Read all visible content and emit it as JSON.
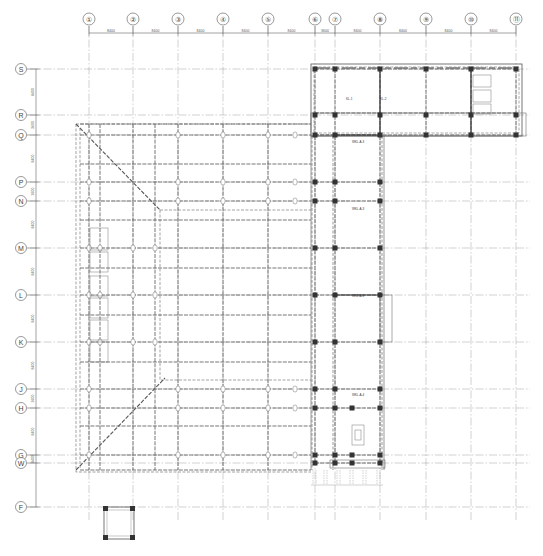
{
  "drawing": {
    "type": "structural-framing-plan",
    "background": "#ffffff",
    "line_color": "#555555",
    "column_color": "#333333"
  },
  "column_axes": [
    {
      "label": "①",
      "x": 89
    },
    {
      "label": "②",
      "x": 133
    },
    {
      "label": "③",
      "x": 178
    },
    {
      "label": "④",
      "x": 223
    },
    {
      "label": "⑤",
      "x": 268
    },
    {
      "label": "⑥",
      "x": 315
    },
    {
      "label": "⑦",
      "x": 335
    },
    {
      "label": "⑧",
      "x": 380
    },
    {
      "label": "⑨",
      "x": 426
    },
    {
      "label": "⑩",
      "x": 471
    },
    {
      "label": "⑪",
      "x": 516
    }
  ],
  "row_axes": [
    {
      "label": "S",
      "y": 69
    },
    {
      "label": "R",
      "y": 115
    },
    {
      "label": "Q",
      "y": 135
    },
    {
      "label": "P",
      "y": 182
    },
    {
      "label": "N",
      "y": 201
    },
    {
      "label": "M",
      "y": 248
    },
    {
      "label": "L",
      "y": 295
    },
    {
      "label": "K",
      "y": 342
    },
    {
      "label": "J",
      "y": 389
    },
    {
      "label": "H",
      "y": 408
    },
    {
      "label": "G",
      "y": 455
    },
    {
      "label": "W",
      "y": 463
    },
    {
      "label": "F",
      "y": 507
    }
  ],
  "top_dimensions": [
    "8400",
    "8400",
    "8400",
    "8400",
    "8400",
    "3600",
    "8400",
    "8400",
    "8400",
    "8400"
  ],
  "left_dimensions": [
    "8400",
    "3600",
    "8400",
    "3600",
    "8400",
    "8400",
    "8400",
    "8400",
    "3600",
    "8400",
    "8400"
  ],
  "beam_tags": [
    {
      "text": "KL-1",
      "x": 346,
      "y": 100
    },
    {
      "text": "KL-2",
      "x": 380,
      "y": 100
    },
    {
      "text": "WKL-A-3",
      "x": 352,
      "y": 143
    },
    {
      "text": "WKL-A-3",
      "x": 352,
      "y": 210
    },
    {
      "text": "WKL-A-3",
      "x": 352,
      "y": 297
    },
    {
      "text": "WKL-A-4",
      "x": 352,
      "y": 396
    }
  ]
}
